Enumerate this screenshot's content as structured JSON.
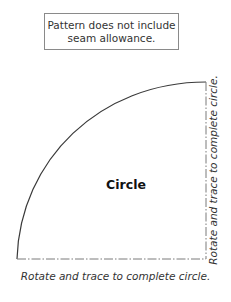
{
  "note": {
    "line1": "Pattern does not include",
    "line2": "seam allowance."
  },
  "pattern": {
    "title": "Circle",
    "bottom_label": "Rotate and trace to complete circle.",
    "side_label": "Rotate and trace to complete circle.",
    "colors": {
      "outline": "#3a3a3a",
      "fold_line": "#7a7a7a",
      "box_border": "#8a8a8a"
    }
  }
}
